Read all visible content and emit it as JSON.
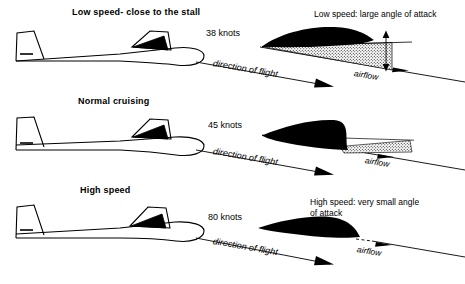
{
  "figure": {
    "title_implicit": "Angle of attack at different airspeeds",
    "background_color": "#ffffff",
    "ink_color": "#000000"
  },
  "panels": [
    {
      "id": "low-speed",
      "title": "Low speed- close to the stall",
      "speed_label": "38 knots",
      "speed_value": 38,
      "speed_unit": "knots",
      "flight_label": "direction of flight",
      "airflow_label": "airflow",
      "caption": "Low speed: large angle of attack",
      "caption_lines": [
        "Low speed: large angle of attack"
      ],
      "angle_of_attack": "large",
      "wedge_visible": true
    },
    {
      "id": "normal-cruising",
      "title": "Normal cruising",
      "speed_label": "45 knots",
      "speed_value": 45,
      "speed_unit": "knots",
      "flight_label": "direction of flight",
      "airflow_label": "airflow",
      "caption": "",
      "caption_lines": [],
      "angle_of_attack": "moderate",
      "wedge_visible": true
    },
    {
      "id": "high-speed",
      "title": "High speed",
      "speed_label": "80 knots",
      "speed_value": 80,
      "speed_unit": "knots",
      "flight_label": "direction of flight",
      "airflow_label": "airflow",
      "caption": "High speed: very small angle of attack",
      "caption_lines": [
        "High speed: very small angle",
        "of attack"
      ],
      "angle_of_attack": "very small",
      "wedge_visible": false
    }
  ]
}
